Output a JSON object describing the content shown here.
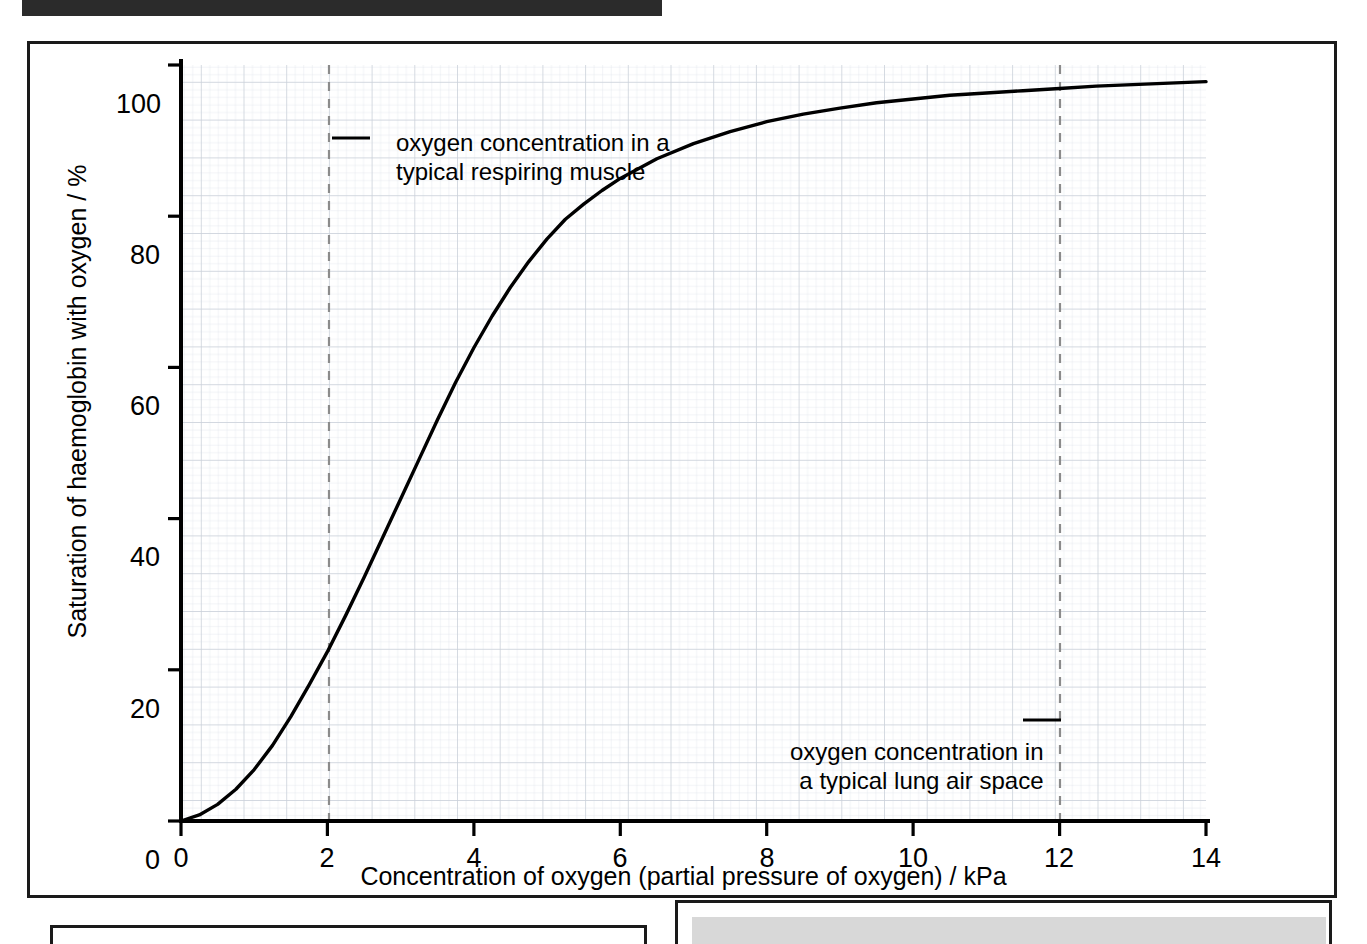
{
  "figure": {
    "top_bar_color": "#2b2b2b",
    "border_color": "#1a1a1a",
    "grid_color": "#d3d9e0",
    "grid_major_color": "#c2cad4",
    "curve_color": "#000000",
    "marker_color": "#7a7a7a"
  },
  "annotations": {
    "muscle_line1": "oxygen concentration in a",
    "muscle_line2": "typical respiring muscle",
    "lung_line1": "oxygen concentration in",
    "lung_line2": "a typical lung air space"
  },
  "bottom_panels": {
    "left_label": "",
    "right_label": "",
    "right_fill_color": "#d8d8d8"
  },
  "chart_data": {
    "type": "line",
    "title": "",
    "xlabel": "Concentration of oxygen (partial pressure of oxygen) / kPa",
    "ylabel": "Saturation of haemoglobin with oxygen / %",
    "xlim": [
      0,
      14
    ],
    "ylim": [
      0,
      100
    ],
    "xticks": [
      0,
      2,
      4,
      6,
      8,
      10,
      12,
      14
    ],
    "xtick_labels": [
      "0",
      "2",
      "4",
      "6",
      "8",
      "10",
      "12",
      "14"
    ],
    "yticks": [
      0,
      20,
      40,
      60,
      80,
      100
    ],
    "ytick_labels": [
      "0",
      "20",
      "40",
      "60",
      "80",
      "100"
    ],
    "grid": true,
    "grid_minor_step": 0.2,
    "grid_major_step": 1,
    "legend": "none",
    "series": [
      {
        "name": "Oxyhaemoglobin dissociation curve",
        "x": [
          0,
          0.25,
          0.5,
          0.75,
          1.0,
          1.25,
          1.5,
          1.75,
          2.0,
          2.25,
          2.5,
          2.75,
          3.0,
          3.25,
          3.5,
          3.75,
          4.0,
          4.25,
          4.5,
          4.75,
          5.0,
          5.25,
          5.5,
          5.75,
          6.0,
          6.5,
          7.0,
          7.5,
          8.0,
          8.5,
          9.0,
          9.5,
          10.0,
          10.5,
          11.0,
          11.5,
          12.0,
          12.5,
          13.0,
          13.5,
          14.0
        ],
        "y": [
          0,
          0.8,
          2.2,
          4.2,
          6.8,
          10.0,
          13.8,
          18.0,
          22.4,
          27.2,
          32.2,
          37.4,
          42.6,
          47.8,
          53.0,
          58.0,
          62.6,
          66.8,
          70.6,
          74.0,
          77.0,
          79.6,
          81.6,
          83.4,
          85.0,
          87.6,
          89.6,
          91.2,
          92.5,
          93.5,
          94.3,
          95.0,
          95.5,
          96.0,
          96.3,
          96.6,
          96.9,
          97.2,
          97.4,
          97.6,
          97.8
        ]
      }
    ],
    "reference_lines": [
      {
        "name": "typical respiring muscle",
        "x": 2,
        "style": "dashed"
      },
      {
        "name": "typical lung air space",
        "x": 12,
        "style": "dashed"
      }
    ]
  }
}
